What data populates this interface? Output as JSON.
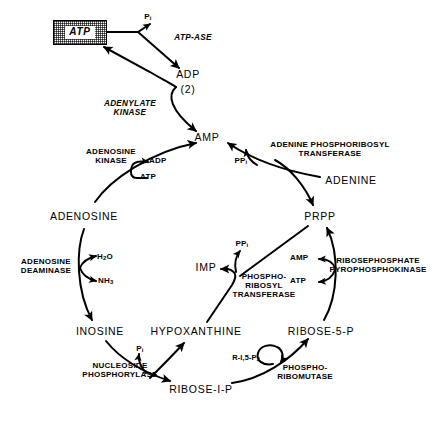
{
  "figure": {
    "kind": "metabolic-pathway-diagram",
    "background_color": "#ffffff",
    "ink_color": "#000000"
  },
  "metabolites": [
    {
      "id": "atp_boxed",
      "label": "ATP",
      "boxed": true,
      "x": 88,
      "y": 33
    },
    {
      "id": "adp",
      "label": "ADP",
      "x": 188,
      "y": 76
    },
    {
      "id": "adp_count",
      "label": "(2)",
      "x": 188,
      "y": 91
    },
    {
      "id": "amp",
      "label": "AMP",
      "x": 205,
      "y": 139
    },
    {
      "id": "adenine",
      "label": "ADENINE",
      "x": 345,
      "y": 181
    },
    {
      "id": "adenosine",
      "label": "ADENOSINE",
      "x": 83,
      "y": 217
    },
    {
      "id": "prpp",
      "label": "PRPP",
      "x": 320,
      "y": 216
    },
    {
      "id": "imp",
      "label": "IMP",
      "x": 206,
      "y": 268
    },
    {
      "id": "inosine",
      "label": "INOSINE",
      "x": 100,
      "y": 332
    },
    {
      "id": "hypoxanthine",
      "label": "HYPOXANTHINE",
      "x": 196,
      "y": 332
    },
    {
      "id": "ribose5p",
      "label": "RIBOSE-5-P",
      "x": 320,
      "y": 332
    },
    {
      "id": "ribose1p",
      "label": "RIBOSE-I-P",
      "x": 200,
      "y": 390
    }
  ],
  "enzymes": [
    {
      "id": "atp_ase",
      "lines": [
        "ATP-ASE"
      ],
      "style": "italic",
      "x": 193,
      "y": 36
    },
    {
      "id": "adenylate_kinase",
      "lines": [
        "ADENYLATE",
        "KINASE"
      ],
      "style": "italic",
      "x": 130,
      "y": 104
    },
    {
      "id": "adenosine_kinase",
      "lines": [
        "ADENOSINE",
        "KINASE"
      ],
      "style": "bold",
      "x": 111,
      "y": 152
    },
    {
      "id": "adenine_prt",
      "lines": [
        "ADENINE  PHOSPHORIBOSYL",
        "TRANSFERASE"
      ],
      "style": "bold",
      "x": 327,
      "y": 145
    },
    {
      "id": "adenosine_deaminase",
      "lines": [
        "ADENOSINE",
        "DEAMINASE"
      ],
      "style": "bold",
      "x": 46,
      "y": 262
    },
    {
      "id": "hgprt",
      "lines": [
        "PHOSPHO-",
        "RIBOSYL",
        "TRANSFERASE"
      ],
      "style": "bold",
      "x": 262,
      "y": 277
    },
    {
      "id": "ribosephosphate_pyrophosphokinase",
      "lines": [
        "RIBOSEPHOSPHATE",
        "PYROPHOSPHOKINASE"
      ],
      "style": "bold",
      "x": 377,
      "y": 261
    },
    {
      "id": "nucleoside_phosphorylase",
      "lines": [
        "NUCLEOSIDE",
        "PHOSPHORYLASE"
      ],
      "style": "bold",
      "x": 120,
      "y": 366
    },
    {
      "id": "phosphoribomutase",
      "lines": [
        "PHOSPHO-",
        "RIBOMUTASE"
      ],
      "style": "bold",
      "x": 303,
      "y": 368
    }
  ],
  "cofactors": [
    {
      "id": "pi_top",
      "label": "P",
      "subscript": "i",
      "x": 145,
      "y": 16
    },
    {
      "id": "adp_kinase",
      "label": "ADP",
      "subscript": "",
      "x": 157,
      "y": 162
    },
    {
      "id": "atp_kinase",
      "label": "ATP",
      "subscript": "",
      "x": 148,
      "y": 178
    },
    {
      "id": "ppi_adenine",
      "label": "PP",
      "subscript": "i",
      "x": 240,
      "y": 160
    },
    {
      "id": "h2o",
      "label": "H",
      "subscript": "2",
      "suffix": "O",
      "x": 99,
      "y": 258
    },
    {
      "id": "nh3",
      "label": "NH",
      "subscript": "3",
      "x": 100,
      "y": 282
    },
    {
      "id": "ppi_imp",
      "label": "PP",
      "subscript": "i",
      "x": 239,
      "y": 243
    },
    {
      "id": "amp_rpk",
      "label": "AMP",
      "subscript": "",
      "x": 298,
      "y": 259
    },
    {
      "id": "atp_rpk",
      "label": "ATP",
      "subscript": "",
      "x": 298,
      "y": 282
    },
    {
      "id": "pi_np",
      "label": "P",
      "subscript": "i",
      "x": 138,
      "y": 349
    },
    {
      "id": "r15p2",
      "label": "R-I,5-P",
      "subscript": "2",
      "x": 245,
      "y": 358
    }
  ],
  "reactions": [
    {
      "id": "atp-to-pi",
      "from": "ATP",
      "to": "Pi"
    },
    {
      "id": "atp-to-adp",
      "from": "ATP",
      "to": "ADP",
      "enzyme": "ATP-ASE"
    },
    {
      "id": "adp-to-amp",
      "from": "ADP (2)",
      "to": "AMP",
      "enzyme": "ADENYLATE KINASE"
    },
    {
      "id": "adp-to-atp",
      "from": "ADP (2)",
      "to": "ATP",
      "enzyme": "ADENYLATE KINASE"
    },
    {
      "id": "adenosine-to-amp",
      "from": "ADENOSINE",
      "to": "AMP",
      "enzyme": "ADENOSINE KINASE"
    },
    {
      "id": "adenine-to-amp",
      "from": "ADENINE",
      "to": "AMP",
      "enzyme": "ADENINE PHOSPHORIBOSYL TRANSFERASE"
    },
    {
      "id": "prpp-to-adenine-branch",
      "from": "PRPP",
      "to": "ADENINE PHOSPHORIBOSYL TRANSFERASE"
    },
    {
      "id": "adenosine-to-inosine",
      "from": "ADENOSINE",
      "to": "INOSINE",
      "enzyme": "ADENOSINE DEAMINASE"
    },
    {
      "id": "hypoxanthine-to-imp",
      "from": "HYPOXANTHINE",
      "to": "IMP",
      "enzyme": "PHOSPHORIBOSYL TRANSFERASE"
    },
    {
      "id": "prpp-to-imp-branch",
      "from": "PRPP",
      "to": "PHOSPHORIBOSYL TRANSFERASE"
    },
    {
      "id": "ribose5p-to-prpp",
      "from": "RIBOSE-5-P",
      "to": "PRPP",
      "enzyme": "RIBOSEPHOSPHATE PYROPHOSPHOKINASE"
    },
    {
      "id": "inosine-to-ribose1p",
      "from": "INOSINE",
      "to": "RIBOSE-I-P",
      "enzyme": "NUCLEOSIDE PHOSPHORYLASE"
    },
    {
      "id": "inosine-to-hypoxanthine",
      "from": "INOSINE",
      "to": "HYPOXANTHINE",
      "enzyme": "NUCLEOSIDE PHOSPHORYLASE"
    },
    {
      "id": "ribose1p-to-ribose5p",
      "from": "RIBOSE-I-P",
      "to": "RIBOSE-5-P",
      "enzyme": "PHOSPHO-RIBOMUTASE"
    }
  ]
}
